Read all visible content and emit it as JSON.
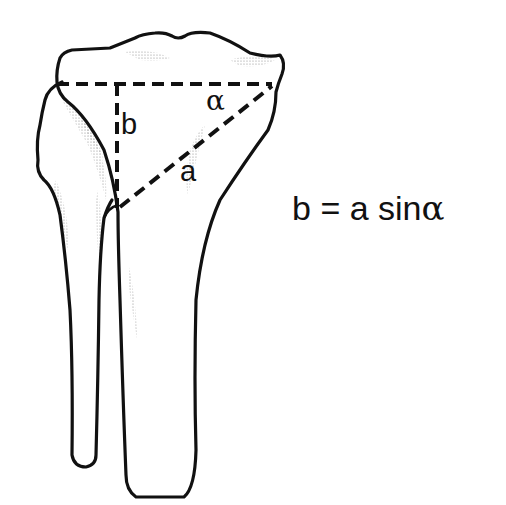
{
  "figure": {
    "title": "",
    "labels": {
      "b": "b",
      "a": "a",
      "alpha": "α"
    },
    "formula": {
      "lhs": "b",
      "equals": "=",
      "rhs_a": "a",
      "rhs_func": "sin",
      "rhs_angle": "α"
    },
    "colors": {
      "stroke": "#111111",
      "background": "#ffffff",
      "stipple": "#9a9a9a"
    }
  }
}
